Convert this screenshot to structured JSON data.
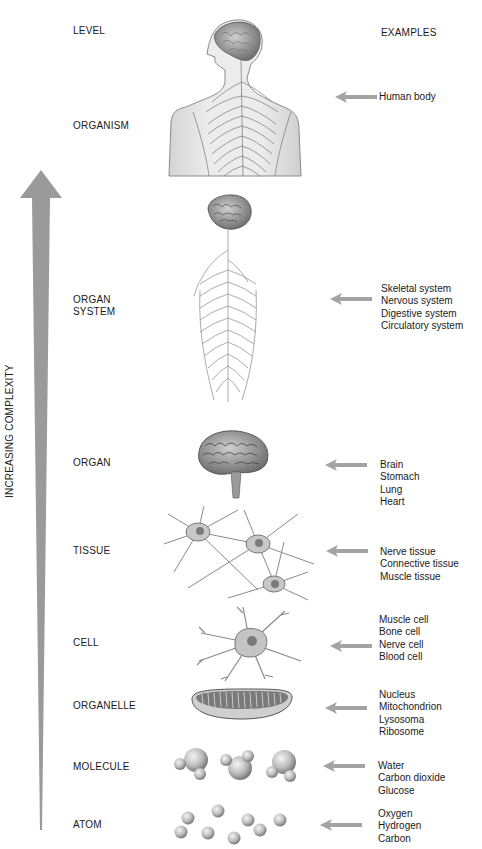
{
  "headers": {
    "level": "LEVEL",
    "examples": "EXAMPLES"
  },
  "axis": {
    "label": "INCREASING COMPLEXITY",
    "arrow_color": "#9a9a9a",
    "direction": "up"
  },
  "pointer_color": "#a3a3a3",
  "levels": [
    {
      "id": "organism",
      "lines": [
        "ORGANISM"
      ],
      "illustration": "human-torso-nervous-system-icon",
      "examples": [
        "Human body"
      ]
    },
    {
      "id": "organ-system",
      "lines": [
        "ORGAN",
        "SYSTEM"
      ],
      "illustration": "brain-spinal-cord-icon",
      "examples": [
        "Skeletal system",
        "Nervous system",
        "Digestive system",
        "Circulatory system"
      ]
    },
    {
      "id": "organ",
      "lines": [
        "ORGAN"
      ],
      "illustration": "brain-icon",
      "examples": [
        "Brain",
        "Stomach",
        "Lung",
        "Heart"
      ]
    },
    {
      "id": "tissue",
      "lines": [
        "TISSUE"
      ],
      "illustration": "nerve-tissue-icon",
      "examples": [
        "Nerve tissue",
        "Connective tissue",
        "Muscle tissue"
      ]
    },
    {
      "id": "cell",
      "lines": [
        "CELL"
      ],
      "illustration": "neuron-icon",
      "examples": [
        "Muscle cell",
        "Bone cell",
        "Nerve cell",
        "Blood cell"
      ]
    },
    {
      "id": "organelle",
      "lines": [
        "ORGANELLE"
      ],
      "illustration": "mitochondrion-icon",
      "examples": [
        "Nucleus",
        "Mitochondrion",
        "Lysosoma",
        "Ribosome"
      ]
    },
    {
      "id": "molecule",
      "lines": [
        "MOLECULE"
      ],
      "illustration": "water-molecules-icon",
      "examples": [
        "Water",
        "Carbon dioxide",
        "Glucose"
      ]
    },
    {
      "id": "atom",
      "lines": [
        "ATOM"
      ],
      "illustration": "atoms-icon",
      "examples": [
        "Oxygen",
        "Hydrogen",
        "Carbon"
      ]
    }
  ]
}
